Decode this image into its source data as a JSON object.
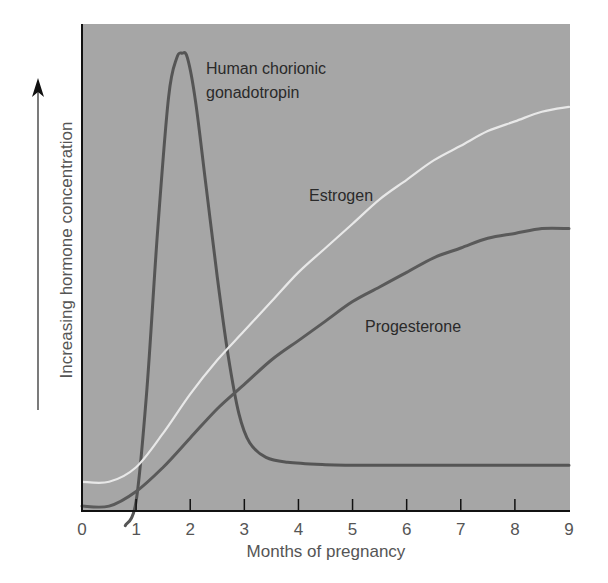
{
  "chart_data": {
    "type": "line",
    "title": "",
    "xlabel": "Months of pregnancy",
    "ylabel": "Increasing hormone concentration",
    "xlim": [
      0,
      9
    ],
    "ylim": [
      0,
      100
    ],
    "x_ticks": [
      "0",
      "1",
      "2",
      "3",
      "4",
      "5",
      "6",
      "7",
      "8",
      "9"
    ],
    "y_ticks": [],
    "grid": false,
    "legend": "inline labels",
    "background_color": "#a6a6a6",
    "series": [
      {
        "name": "Human chorionic gonadotropin",
        "label_lines": [
          "Human chorionic",
          "gonadotropin"
        ],
        "color": "#555555",
        "x": [
          0.8,
          1.0,
          1.2,
          1.4,
          1.6,
          1.75,
          1.85,
          1.95,
          2.1,
          2.3,
          2.5,
          2.7,
          2.9,
          3.1,
          3.4,
          3.8,
          4.5,
          5,
          6,
          7,
          8,
          9
        ],
        "values": [
          -3,
          2,
          25,
          58,
          85,
          93,
          94,
          93,
          84,
          66,
          48,
          32,
          20,
          14,
          11,
          10,
          9.5,
          9.4,
          9.4,
          9.4,
          9.4,
          9.4
        ]
      },
      {
        "name": "Estrogen",
        "label_lines": [
          "Estrogen"
        ],
        "color": "#e8e8e8",
        "x": [
          0,
          0.5,
          1,
          1.5,
          2,
          2.5,
          3,
          3.5,
          4,
          4.5,
          5,
          5.5,
          6,
          6.5,
          7,
          7.5,
          8,
          8.5,
          9
        ],
        "values": [
          6,
          6,
          9,
          16,
          24,
          31,
          37,
          43,
          49,
          54,
          59,
          64,
          68,
          72,
          75,
          78,
          80,
          82,
          83
        ]
      },
      {
        "name": "Progesterone",
        "label_lines": [
          "Progesterone"
        ],
        "color": "#5a5a5a",
        "x": [
          0,
          0.5,
          1,
          1.5,
          2,
          2.5,
          3,
          3.5,
          4,
          4.5,
          5,
          5.5,
          6,
          6.5,
          7,
          7.5,
          8,
          8.5,
          9
        ],
        "values": [
          1,
          1,
          4,
          9,
          15,
          21,
          26,
          31,
          35,
          39,
          43,
          46,
          49,
          52,
          54,
          56,
          57,
          58,
          58
        ]
      }
    ]
  }
}
